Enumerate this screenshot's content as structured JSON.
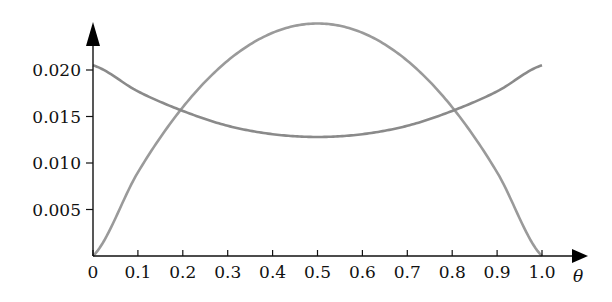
{
  "chart_data": {
    "type": "line",
    "title": "",
    "xlabel": "θ",
    "ylabel": "",
    "xlim": [
      0,
      1.0
    ],
    "ylim": [
      0,
      0.025
    ],
    "x_ticks": [
      "0",
      "0.1",
      "0.2",
      "0.3",
      "0.4",
      "0.5",
      "0.6",
      "0.7",
      "0.8",
      "0.9",
      "1.0"
    ],
    "y_ticks": [
      "0.005",
      "0.010",
      "0.015",
      "0.020"
    ],
    "grid": false,
    "legend": null,
    "x": [
      0,
      0.1,
      0.2,
      0.3,
      0.4,
      0.5,
      0.6,
      0.7,
      0.8,
      0.9,
      1.0
    ],
    "series": [
      {
        "name": "parabola",
        "color": "#9a9a9a",
        "values": [
          0,
          0.009,
          0.016,
          0.021,
          0.024,
          0.025,
          0.024,
          0.021,
          0.016,
          0.009,
          0
        ]
      },
      {
        "name": "u-curve",
        "color": "#8a8a8a",
        "values": [
          0.0205,
          0.0177,
          0.0156,
          0.014,
          0.0131,
          0.0128,
          0.0131,
          0.014,
          0.0156,
          0.0177,
          0.0205
        ]
      }
    ]
  }
}
